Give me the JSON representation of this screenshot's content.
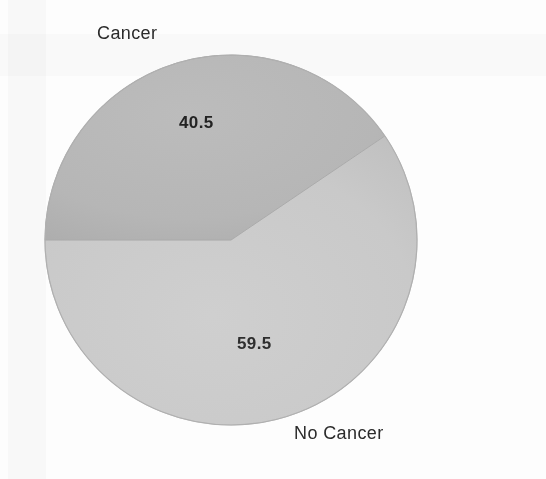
{
  "figure": {
    "background_color": "#fdfdfd",
    "kind": "pie-chart-scan"
  },
  "chart_data": {
    "type": "pie",
    "title": "",
    "subtitle": "",
    "xlabel": "",
    "ylabel": "",
    "labels": [
      "Cancer",
      "No Cancer"
    ],
    "values": [
      40.5,
      59.5
    ],
    "value_labels": [
      "40.5",
      "59.5"
    ],
    "units": "percent",
    "total": 100.0,
    "legend_position": "none",
    "grid": false,
    "slices": [
      {
        "label": "Cancer",
        "value": 40.5,
        "value_label": "40.5",
        "color": "#b6b6b6",
        "start_angle_deg": 180,
        "end_angle_deg": 325.8,
        "sweep_deg": 145.8,
        "label_position": "top-left-outside",
        "value_label_position": "inside-upper"
      },
      {
        "label": "No Cancer",
        "value": 59.5,
        "value_label": "59.5",
        "color": "#c9c9c9",
        "start_angle_deg": 325.8,
        "end_angle_deg": 540,
        "sweep_deg": 214.2,
        "label_position": "bottom-right-outside",
        "value_label_position": "inside-lower"
      }
    ],
    "geometry": {
      "center_x": 231,
      "center_y": 240,
      "radius_x": 186,
      "radius_y": 185
    },
    "annotations": []
  },
  "labels": {
    "cancer": "Cancer",
    "no_cancer": "No Cancer",
    "cancer_value": "40.5",
    "no_cancer_value": "59.5"
  },
  "colors": {
    "cancer_slice": "#b6b6b6",
    "no_cancer_slice": "#c9c9c9",
    "slice_outline": "#a8a8a8",
    "text": "#2b2b2b",
    "background": "#fdfdfd"
  }
}
